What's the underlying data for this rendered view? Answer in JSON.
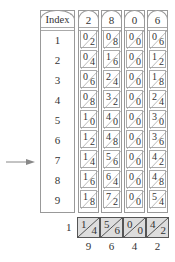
{
  "index_rod": {
    "label": "Index",
    "numbers": [
      "1",
      "2",
      "3",
      "4",
      "5",
      "6",
      "7",
      "8",
      "9"
    ]
  },
  "rods": [
    {
      "header": "2",
      "cells": [
        [
          "0",
          "2"
        ],
        [
          "0",
          "4"
        ],
        [
          "0",
          "6"
        ],
        [
          "0",
          "8"
        ],
        [
          "1",
          "0"
        ],
        [
          "1",
          "2"
        ],
        [
          "1",
          "4"
        ],
        [
          "1",
          "6"
        ],
        [
          "1",
          "8"
        ]
      ]
    },
    {
      "header": "8",
      "cells": [
        [
          "0",
          "8"
        ],
        [
          "1",
          "6"
        ],
        [
          "2",
          "4"
        ],
        [
          "3",
          "2"
        ],
        [
          "4",
          "0"
        ],
        [
          "4",
          "8"
        ],
        [
          "5",
          "6"
        ],
        [
          "6",
          "4"
        ],
        [
          "7",
          "2"
        ]
      ]
    },
    {
      "header": "0",
      "cells": [
        [
          "0",
          "0"
        ],
        [
          "0",
          "0"
        ],
        [
          "0",
          "0"
        ],
        [
          "0",
          "0"
        ],
        [
          "0",
          "0"
        ],
        [
          "0",
          "0"
        ],
        [
          "0",
          "0"
        ],
        [
          "0",
          "0"
        ],
        [
          "0",
          "0"
        ]
      ]
    },
    {
      "header": "6",
      "cells": [
        [
          "0",
          "6"
        ],
        [
          "1",
          "2"
        ],
        [
          "1",
          "8"
        ],
        [
          "2",
          "4"
        ],
        [
          "3",
          "0"
        ],
        [
          "3",
          "6"
        ],
        [
          "4",
          "2"
        ],
        [
          "4",
          "8"
        ],
        [
          "5",
          "4"
        ]
      ]
    }
  ],
  "selected_row": "7",
  "result": {
    "carry": "1",
    "boxes": [
      [
        "1",
        "4"
      ],
      [
        "5",
        "6"
      ],
      [
        "0",
        "0"
      ],
      [
        "4",
        "2"
      ]
    ],
    "digits": [
      "9",
      "6",
      "4",
      "2"
    ]
  },
  "colors": {
    "line": "#999999",
    "result_fill": "#dddddd",
    "arrow": "#888888"
  }
}
